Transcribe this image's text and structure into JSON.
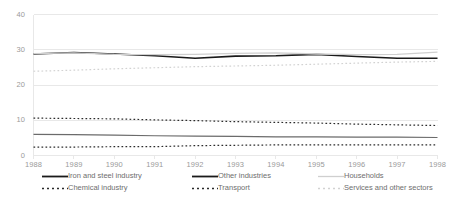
{
  "chart_data": {
    "type": "line",
    "title": "",
    "subtitle": "",
    "xlabel": "",
    "ylabel": "",
    "x": [
      1988,
      1989,
      1990,
      1991,
      1992,
      1993,
      1994,
      1995,
      1996,
      1997,
      1998
    ],
    "categories": [
      "1988",
      "1989",
      "1990",
      "1991",
      "1992",
      "1993",
      "1994",
      "1995",
      "1996",
      "1997",
      "1998"
    ],
    "ylim": [
      0,
      40
    ],
    "yticks": [
      0,
      10,
      20,
      30,
      40
    ],
    "ytick_labels": [
      "0",
      "10",
      "20",
      "30",
      "40"
    ],
    "grid": true,
    "grid_axis": "y",
    "legend_position": "bottom",
    "series": [
      {
        "name": "Iron and steel industry",
        "style": "solid",
        "color": "#1a1a1a",
        "width": 1.6,
        "values": [
          28.8,
          29.2,
          28.8,
          28.3,
          27.6,
          28.2,
          28.3,
          28.7,
          28.1,
          27.6,
          27.6
        ]
      },
      {
        "name": "Chemical industry",
        "style": "dashed",
        "color": "#2b2b2b",
        "width": 1.2,
        "values": [
          2.4,
          2.4,
          2.5,
          2.5,
          2.8,
          2.9,
          3.0,
          3.0,
          3.0,
          3.0,
          3.0
        ]
      },
      {
        "name": "Other industries",
        "style": "solid",
        "color": "#6b6b6b",
        "width": 1.2,
        "values": [
          6.0,
          5.9,
          5.8,
          5.6,
          5.5,
          5.4,
          5.3,
          5.3,
          5.2,
          5.2,
          5.1
        ]
      },
      {
        "name": "Transport",
        "style": "dashed",
        "color": "#2b2b2b",
        "width": 1.2,
        "values": [
          10.6,
          10.5,
          10.4,
          10.1,
          9.9,
          9.6,
          9.4,
          9.2,
          8.9,
          8.7,
          8.5
        ]
      },
      {
        "name": "Households",
        "style": "solid",
        "color": "#cfcfcf",
        "width": 1.3,
        "values": [
          28.9,
          29.1,
          28.7,
          28.6,
          28.7,
          29.0,
          29.1,
          28.8,
          28.6,
          28.7,
          29.3
        ]
      },
      {
        "name": "Services and other sectors",
        "style": "dashed",
        "color": "#d2d2d2",
        "width": 1.2,
        "values": [
          23.9,
          24.2,
          24.6,
          24.9,
          25.2,
          25.4,
          25.6,
          25.9,
          26.2,
          26.5,
          26.7
        ]
      }
    ]
  },
  "legend": {
    "items": [
      {
        "label": "Iron and steel industry",
        "style": "solid",
        "color": "#1a1a1a",
        "width": 1.8
      },
      {
        "label": "Chemical industry",
        "style": "dashed",
        "color": "#2b2b2b",
        "width": 1.3
      },
      {
        "label": "Other industries",
        "style": "solid",
        "color": "#1a1a1a",
        "width": 1.8
      },
      {
        "label": "Transport",
        "style": "dashed",
        "color": "#2b2b2b",
        "width": 1.3
      },
      {
        "label": "Households",
        "style": "solid",
        "color": "#cfcfcf",
        "width": 1.3
      },
      {
        "label": "Services and other sectors",
        "style": "dashed",
        "color": "#d2d2d2",
        "width": 1.3
      }
    ]
  },
  "colors": {
    "grid": "#e8e8e8",
    "axis_text": "#9a9a9a",
    "legend_text": "#6e6e6e",
    "background": "#ffffff"
  }
}
